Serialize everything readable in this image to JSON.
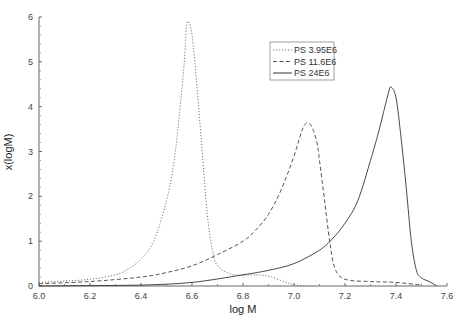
{
  "chart_data": {
    "type": "line",
    "title": "",
    "xlabel": "log M",
    "ylabel": "x(logM)",
    "xlim": [
      6.0,
      7.6
    ],
    "ylim": [
      0,
      6
    ],
    "x_ticks": [
      "6.0",
      "6.2",
      "6.4",
      "6.6",
      "6.8",
      "7.0",
      "7.2",
      "7.4",
      "7.6"
    ],
    "y_ticks": [
      "0",
      "1",
      "2",
      "3",
      "4",
      "5",
      "6"
    ],
    "grid": false,
    "legend_position": "top-right",
    "series": [
      {
        "name": "PS 3.95E6",
        "style": "dotted",
        "color": "#777777",
        "x": [
          6.0,
          6.1,
          6.2,
          6.3,
          6.35,
          6.4,
          6.45,
          6.5,
          6.53,
          6.55,
          6.57,
          6.58,
          6.6,
          6.62,
          6.64,
          6.66,
          6.68,
          6.7,
          6.75,
          6.8,
          6.85,
          6.9,
          6.95,
          7.0,
          7.05
        ],
        "y": [
          0.08,
          0.11,
          0.15,
          0.25,
          0.38,
          0.6,
          1.0,
          1.9,
          2.8,
          3.8,
          5.0,
          5.87,
          5.6,
          4.4,
          3.0,
          1.6,
          0.8,
          0.45,
          0.27,
          0.24,
          0.25,
          0.22,
          0.12,
          0.03,
          0.0
        ]
      },
      {
        "name": "PS 11.6E6",
        "style": "dashed",
        "color": "#555555",
        "x": [
          6.0,
          6.2,
          6.4,
          6.5,
          6.6,
          6.7,
          6.8,
          6.85,
          6.9,
          6.95,
          7.0,
          7.03,
          7.05,
          7.07,
          7.09,
          7.1,
          7.12,
          7.14,
          7.16,
          7.2,
          7.3,
          7.4,
          7.5
        ],
        "y": [
          0.05,
          0.1,
          0.2,
          0.3,
          0.45,
          0.7,
          1.0,
          1.25,
          1.6,
          2.15,
          2.9,
          3.45,
          3.64,
          3.55,
          3.2,
          2.8,
          1.9,
          1.0,
          0.4,
          0.15,
          0.1,
          0.08,
          0.02
        ]
      },
      {
        "name": "PS 24E6",
        "style": "solid",
        "color": "#333333",
        "x": [
          6.0,
          6.2,
          6.4,
          6.6,
          6.8,
          6.9,
          7.0,
          7.1,
          7.15,
          7.2,
          7.25,
          7.3,
          7.33,
          7.35,
          7.37,
          7.38,
          7.4,
          7.42,
          7.44,
          7.46,
          7.48,
          7.5,
          7.53,
          7.56
        ],
        "y": [
          0.0,
          0.01,
          0.02,
          0.08,
          0.25,
          0.35,
          0.5,
          0.8,
          1.05,
          1.4,
          1.9,
          2.8,
          3.4,
          3.85,
          4.3,
          4.44,
          4.2,
          3.3,
          2.2,
          1.0,
          0.35,
          0.18,
          0.1,
          0.0
        ]
      }
    ]
  }
}
